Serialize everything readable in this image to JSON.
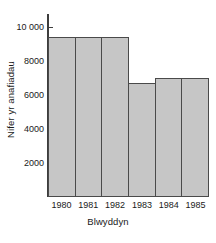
{
  "chart_data": {
    "type": "bar",
    "title": "",
    "xlabel": "Blwyddyn",
    "ylabel": "Nifer yr anafiadau",
    "categories": [
      "1980",
      "1981",
      "1982",
      "1983",
      "1984",
      "1985"
    ],
    "values": [
      9450,
      9450,
      9450,
      6700,
      7000,
      7000
    ],
    "ylim": [
      0,
      10800
    ],
    "yticks": [
      2000,
      4000,
      6000,
      8000,
      10000
    ],
    "ytick_labels": [
      "2000",
      "4000",
      "6000",
      "8000",
      "10 000"
    ],
    "grid": false,
    "legend": null,
    "bar_fill_color": "#c6c6c6",
    "bar_edge_color": "#4a4a4a",
    "axis_color": "#3d3d3d"
  }
}
